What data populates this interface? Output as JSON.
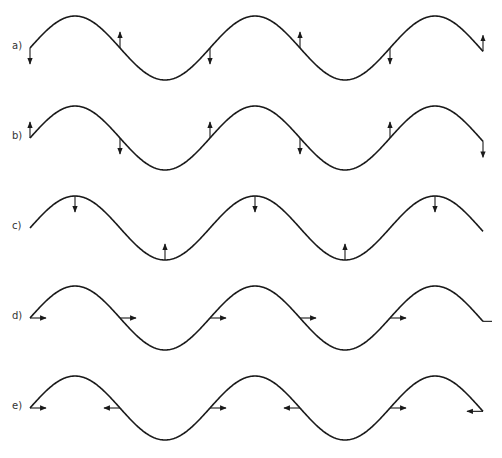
{
  "diagram": {
    "title": "",
    "stroke_color": "#1a1a1a",
    "arrow_color": "#1a1a1a",
    "wave": {
      "x_start": 30,
      "x_end": 483,
      "wavelength_px": 180,
      "amplitude_px": 32,
      "phase": "starts at midline moving up toward crest"
    },
    "rows": [
      {
        "label": "a)",
        "midline_y": 48,
        "arrows": [
          {
            "x": 30,
            "at": "midline",
            "dir": "down"
          },
          {
            "x": 120,
            "at": "midline",
            "dir": "up"
          },
          {
            "x": 210,
            "at": "midline",
            "dir": "down"
          },
          {
            "x": 300,
            "at": "midline",
            "dir": "up"
          },
          {
            "x": 390,
            "at": "midline",
            "dir": "down"
          },
          {
            "x": 483,
            "at": "midline",
            "dir": "up"
          }
        ]
      },
      {
        "label": "b)",
        "midline_y": 138,
        "arrows": [
          {
            "x": 30,
            "at": "midline",
            "dir": "up"
          },
          {
            "x": 120,
            "at": "midline",
            "dir": "down"
          },
          {
            "x": 210,
            "at": "midline",
            "dir": "up"
          },
          {
            "x": 300,
            "at": "midline",
            "dir": "down"
          },
          {
            "x": 390,
            "at": "midline",
            "dir": "up"
          },
          {
            "x": 483,
            "at": "midline",
            "dir": "down"
          }
        ]
      },
      {
        "label": "c)",
        "midline_y": 228,
        "arrows": [
          {
            "x": 75,
            "at": "crest",
            "dir": "down"
          },
          {
            "x": 165,
            "at": "trough",
            "dir": "up"
          },
          {
            "x": 255,
            "at": "crest",
            "dir": "down"
          },
          {
            "x": 345,
            "at": "trough",
            "dir": "up"
          },
          {
            "x": 435,
            "at": "crest",
            "dir": "down"
          }
        ]
      },
      {
        "label": "d)",
        "midline_y": 318,
        "arrows": [
          {
            "x": 30,
            "at": "midline",
            "dir": "right"
          },
          {
            "x": 120,
            "at": "midline",
            "dir": "right"
          },
          {
            "x": 210,
            "at": "midline",
            "dir": "right"
          },
          {
            "x": 300,
            "at": "midline",
            "dir": "right"
          },
          {
            "x": 390,
            "at": "midline",
            "dir": "right"
          },
          {
            "x": 483,
            "at": "midline",
            "dir": "right-stub"
          }
        ]
      },
      {
        "label": "e)",
        "midline_y": 408,
        "arrows": [
          {
            "x": 30,
            "at": "midline",
            "dir": "right"
          },
          {
            "x": 120,
            "at": "midline",
            "dir": "left"
          },
          {
            "x": 210,
            "at": "midline",
            "dir": "right"
          },
          {
            "x": 300,
            "at": "midline",
            "dir": "left"
          },
          {
            "x": 390,
            "at": "midline",
            "dir": "right"
          },
          {
            "x": 483,
            "at": "midline",
            "dir": "left"
          }
        ]
      }
    ]
  }
}
